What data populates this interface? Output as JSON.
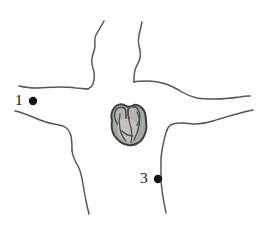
{
  "figure": {
    "type": "anatomical-line-drawing",
    "background_color": "#ffffff",
    "outline_color": "#54545a",
    "width": 271,
    "height": 230
  },
  "heart": {
    "name": "heart-illustration",
    "fill_color": "#a9a7a4",
    "outline_color": "#3c3c3f",
    "center_x": 128,
    "center_y": 125
  },
  "markers": [
    {
      "id": "point-1",
      "label": "1",
      "dot_color": "#151515",
      "dot_x": 33,
      "dot_y": 101,
      "dot_radius": 4.2
    },
    {
      "id": "point-3",
      "label": "3",
      "dot_color": "#151515",
      "dot_x": 158,
      "dot_y": 179,
      "dot_radius": 4.2
    }
  ]
}
